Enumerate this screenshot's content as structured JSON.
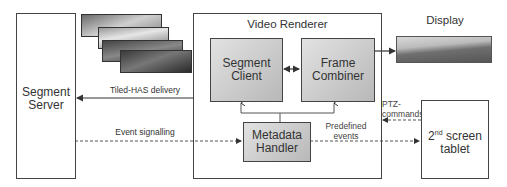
{
  "diagram": {
    "segment_server": {
      "line1": "Segment",
      "line2": "Server"
    },
    "video_renderer": {
      "title": "Video Renderer"
    },
    "segment_client": {
      "line1": "Segment",
      "line2": "Client"
    },
    "frame_combiner": {
      "line1": "Frame",
      "line2": "Combiner"
    },
    "metadata_handler": {
      "line1": "Metadata",
      "line2": "Handler"
    },
    "display": {
      "label": "Display"
    },
    "tablet": {
      "prefix": "2",
      "sup": "nd",
      "suffix": " screen",
      "line2": "tablet"
    },
    "edges": {
      "tiled_has": "Tiled-HAS delivery",
      "event_signalling": "Event signalling",
      "predefined_line1": "Predefined",
      "predefined_line2": "events",
      "ptz_line1": "PTZ-",
      "ptz_line2": "commands"
    }
  }
}
